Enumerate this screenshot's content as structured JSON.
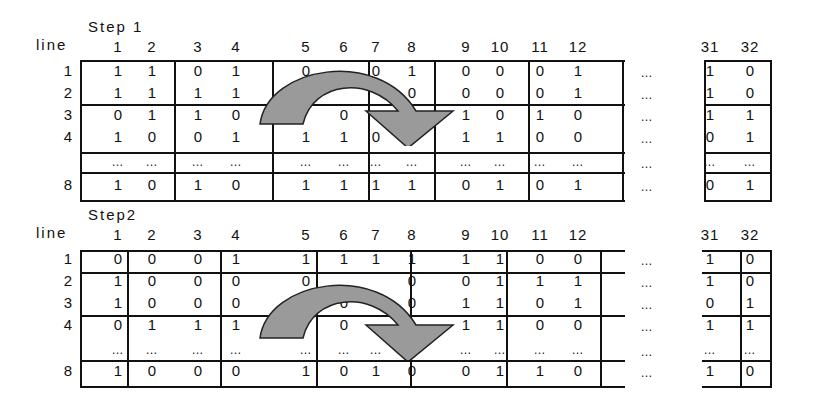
{
  "step1": {
    "title": "Step 1",
    "line_label": "line",
    "columns": [
      "1",
      "2",
      "3",
      "4",
      "5",
      "6",
      "7",
      "8",
      "9",
      "10",
      "11",
      "12",
      "31",
      "32"
    ],
    "rows": [
      {
        "line": "1",
        "values": [
          "1",
          "1",
          "0",
          "1",
          "0",
          "",
          "0",
          "1",
          "0",
          "0",
          "0",
          "1"
        ],
        "tail": [
          "1",
          "0"
        ]
      },
      {
        "line": "2",
        "values": [
          "1",
          "1",
          "1",
          "1",
          "",
          "",
          "",
          "0",
          "0",
          "0",
          "0",
          "1"
        ],
        "tail": [
          "1",
          "0"
        ]
      },
      {
        "line": "3",
        "values": [
          "0",
          "1",
          "1",
          "0",
          "",
          "0",
          "",
          "1",
          "1",
          "0",
          "1",
          "0"
        ],
        "tail": [
          "1",
          "1"
        ]
      },
      {
        "line": "4",
        "values": [
          "1",
          "0",
          "0",
          "1",
          "1",
          "1",
          "0",
          "0",
          "1",
          "1",
          "0",
          "0"
        ],
        "tail": [
          "0",
          "1"
        ]
      },
      {
        "line": "",
        "values": [
          "…",
          "…",
          "…",
          "…",
          "…",
          "…",
          "…",
          "…",
          "…",
          "…",
          "…",
          "…"
        ],
        "tail": [
          "…",
          "…"
        ]
      },
      {
        "line": "8",
        "values": [
          "1",
          "0",
          "1",
          "0",
          "1",
          "1",
          "1",
          "1",
          "0",
          "1",
          "0",
          "1"
        ],
        "tail": [
          "0",
          "1"
        ]
      }
    ],
    "ellipsis": "…"
  },
  "step2": {
    "title": "Step2",
    "line_label": "line",
    "columns": [
      "1",
      "2",
      "3",
      "4",
      "5",
      "6",
      "7",
      "8",
      "9",
      "10",
      "11",
      "12",
      "31",
      "32"
    ],
    "rows": [
      {
        "line": "1",
        "values": [
          "0",
          "0",
          "0",
          "1",
          "1",
          "1",
          "1",
          "1",
          "1",
          "1",
          "0",
          "0"
        ],
        "tail": [
          "1",
          "0"
        ]
      },
      {
        "line": "2",
        "values": [
          "1",
          "0",
          "0",
          "0",
          "0",
          "",
          "",
          "0",
          "0",
          "1",
          "1",
          "1"
        ],
        "tail": [
          "1",
          "0"
        ]
      },
      {
        "line": "3",
        "values": [
          "1",
          "0",
          "0",
          "0",
          "",
          "0",
          "",
          "0",
          "1",
          "1",
          "0",
          "1"
        ],
        "tail": [
          "0",
          "1"
        ]
      },
      {
        "line": "4",
        "values": [
          "0",
          "1",
          "1",
          "1",
          "",
          "0",
          "",
          "",
          "1",
          "1",
          "0",
          "0"
        ],
        "tail": [
          "1",
          "1"
        ]
      },
      {
        "line": "",
        "values": [
          "…",
          "…",
          "…",
          "…",
          "…",
          "…",
          "…",
          "…",
          "…",
          "…",
          "…",
          "…"
        ],
        "tail": [
          "…",
          "…"
        ]
      },
      {
        "line": "8",
        "values": [
          "1",
          "0",
          "0",
          "0",
          "1",
          "0",
          "1",
          "0",
          "0",
          "1",
          "1",
          "0"
        ],
        "tail": [
          "1",
          "0"
        ]
      }
    ],
    "ellipsis": "…"
  },
  "colors": {
    "arrow_fill": "#9a9a9a",
    "line": "#111111"
  }
}
